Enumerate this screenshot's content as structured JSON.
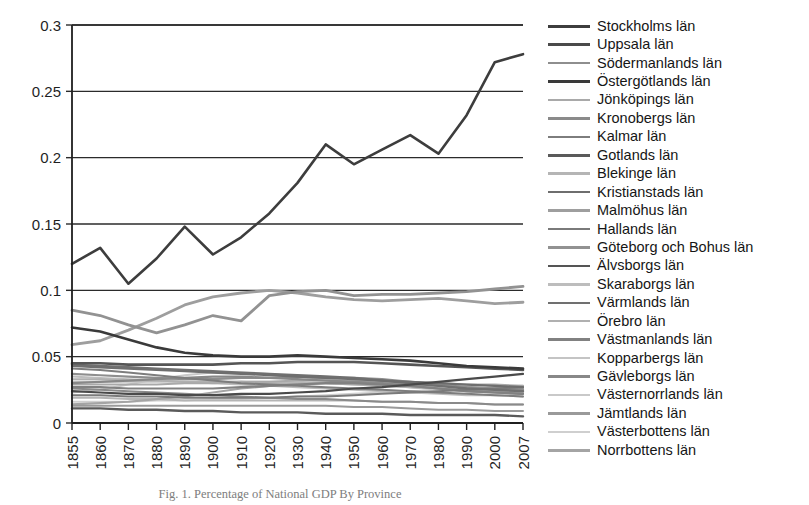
{
  "caption": "Fig. 1. Percentage of National GDP By Province",
  "axes": {
    "y_ticks": [
      "0",
      "0.05",
      "0.1",
      "0.15",
      "0.2",
      "0.25",
      "0.3"
    ],
    "x_ticks": [
      "1855",
      "1860",
      "1870",
      "1880",
      "1890",
      "1900",
      "1910",
      "1920",
      "1930",
      "1940",
      "1950",
      "1960",
      "1970",
      "1980",
      "1990",
      "2000",
      "2007"
    ]
  },
  "chart_data": {
    "type": "line",
    "title": "Fig. 1. Percentage of National GDP By Province",
    "xlabel": "",
    "ylabel": "",
    "ylim": [
      0,
      0.3
    ],
    "ytick_step": 0.05,
    "grid": "horizontal",
    "legend_position": "right",
    "x": [
      1855,
      1860,
      1870,
      1880,
      1890,
      1900,
      1910,
      1920,
      1930,
      1940,
      1950,
      1960,
      1970,
      1980,
      1990,
      2000,
      2007
    ],
    "series": [
      {
        "name": "Stockholms län",
        "color": "#3d3d3d",
        "width": 2.6,
        "values": [
          0.12,
          0.132,
          0.105,
          0.124,
          0.148,
          0.127,
          0.14,
          0.158,
          0.181,
          0.21,
          0.195,
          0.206,
          0.217,
          0.203,
          0.232,
          0.272,
          0.278
        ]
      },
      {
        "name": "Uppsala län",
        "color": "#4a4a4a",
        "width": 2.2,
        "values": [
          0.024,
          0.023,
          0.022,
          0.022,
          0.021,
          0.021,
          0.022,
          0.022,
          0.023,
          0.024,
          0.026,
          0.027,
          0.029,
          0.031,
          0.033,
          0.035,
          0.037
        ]
      },
      {
        "name": "Södermanlands län",
        "color": "#8e8e8e",
        "width": 2.2,
        "values": [
          0.037,
          0.036,
          0.035,
          0.034,
          0.033,
          0.033,
          0.034,
          0.034,
          0.035,
          0.034,
          0.034,
          0.033,
          0.031,
          0.029,
          0.027,
          0.026,
          0.025
        ]
      },
      {
        "name": "Östergötlands län",
        "color": "#3a3a3a",
        "width": 2.6,
        "values": [
          0.072,
          0.069,
          0.063,
          0.057,
          0.053,
          0.051,
          0.05,
          0.05,
          0.051,
          0.05,
          0.049,
          0.048,
          0.047,
          0.045,
          0.043,
          0.042,
          0.041
        ]
      },
      {
        "name": "Jönköpings län",
        "color": "#a9a9a9",
        "width": 2.0,
        "values": [
          0.029,
          0.029,
          0.029,
          0.029,
          0.03,
          0.03,
          0.031,
          0.031,
          0.032,
          0.032,
          0.032,
          0.031,
          0.031,
          0.03,
          0.029,
          0.029,
          0.028
        ]
      },
      {
        "name": "Kronobergs län",
        "color": "#8a8a8a",
        "width": 2.0,
        "values": [
          0.026,
          0.025,
          0.024,
          0.023,
          0.022,
          0.021,
          0.02,
          0.019,
          0.018,
          0.018,
          0.017,
          0.016,
          0.016,
          0.015,
          0.015,
          0.014,
          0.014
        ]
      },
      {
        "name": "Kalmar län",
        "color": "#7d7d7d",
        "width": 2.0,
        "values": [
          0.041,
          0.04,
          0.038,
          0.036,
          0.034,
          0.032,
          0.03,
          0.029,
          0.028,
          0.027,
          0.026,
          0.025,
          0.024,
          0.023,
          0.022,
          0.021,
          0.02
        ]
      },
      {
        "name": "Gotlands län",
        "color": "#5a5a5a",
        "width": 2.4,
        "values": [
          0.011,
          0.011,
          0.01,
          0.01,
          0.009,
          0.009,
          0.008,
          0.008,
          0.008,
          0.007,
          0.007,
          0.007,
          0.006,
          0.006,
          0.006,
          0.006,
          0.005
        ]
      },
      {
        "name": "Blekinge län",
        "color": "#b5b5b5",
        "width": 2.0,
        "values": [
          0.019,
          0.019,
          0.018,
          0.018,
          0.017,
          0.017,
          0.017,
          0.017,
          0.017,
          0.017,
          0.017,
          0.016,
          0.016,
          0.015,
          0.015,
          0.014,
          0.014
        ]
      },
      {
        "name": "Kristianstads län",
        "color": "#6e6e6e",
        "width": 2.2,
        "values": [
          0.043,
          0.042,
          0.041,
          0.04,
          0.039,
          0.038,
          0.037,
          0.036,
          0.035,
          0.034,
          0.033,
          0.032,
          0.031,
          0.03,
          0.029,
          0.028,
          0.027
        ]
      },
      {
        "name": "Malmöhus län",
        "color": "#9e9e9e",
        "width": 2.8,
        "values": [
          0.059,
          0.062,
          0.07,
          0.079,
          0.089,
          0.095,
          0.098,
          0.1,
          0.098,
          0.095,
          0.093,
          0.092,
          0.093,
          0.094,
          0.092,
          0.09,
          0.091
        ]
      },
      {
        "name": "Hallands län",
        "color": "#7a7a7a",
        "width": 2.0,
        "values": [
          0.021,
          0.021,
          0.02,
          0.02,
          0.019,
          0.019,
          0.019,
          0.019,
          0.02,
          0.02,
          0.021,
          0.022,
          0.023,
          0.024,
          0.025,
          0.026,
          0.027
        ]
      },
      {
        "name": "Göteborg och Bohus län",
        "color": "#929292",
        "width": 2.8,
        "values": [
          0.085,
          0.081,
          0.074,
          0.068,
          0.074,
          0.081,
          0.077,
          0.096,
          0.099,
          0.1,
          0.096,
          0.097,
          0.097,
          0.098,
          0.099,
          0.101,
          0.103
        ]
      },
      {
        "name": "Älvsborgs län",
        "color": "#555555",
        "width": 2.6,
        "values": [
          0.045,
          0.045,
          0.044,
          0.044,
          0.044,
          0.044,
          0.045,
          0.045,
          0.046,
          0.046,
          0.046,
          0.045,
          0.044,
          0.043,
          0.042,
          0.041,
          0.04
        ]
      },
      {
        "name": "Skaraborgs län",
        "color": "#bdbdbd",
        "width": 2.0,
        "values": [
          0.035,
          0.034,
          0.033,
          0.032,
          0.031,
          0.03,
          0.029,
          0.028,
          0.027,
          0.026,
          0.025,
          0.024,
          0.023,
          0.022,
          0.021,
          0.021,
          0.02
        ]
      },
      {
        "name": "Värmlands län",
        "color": "#707070",
        "width": 2.4,
        "values": [
          0.044,
          0.043,
          0.042,
          0.041,
          0.04,
          0.039,
          0.038,
          0.037,
          0.036,
          0.035,
          0.034,
          0.032,
          0.03,
          0.028,
          0.026,
          0.025,
          0.024
        ]
      },
      {
        "name": "Örebro län",
        "color": "#b0b0b0",
        "width": 2.0,
        "values": [
          0.033,
          0.033,
          0.032,
          0.032,
          0.031,
          0.031,
          0.031,
          0.03,
          0.03,
          0.03,
          0.029,
          0.028,
          0.027,
          0.026,
          0.025,
          0.024,
          0.023
        ]
      },
      {
        "name": "Västmanlands län",
        "color": "#818181",
        "width": 2.2,
        "values": [
          0.027,
          0.027,
          0.026,
          0.026,
          0.026,
          0.026,
          0.027,
          0.028,
          0.029,
          0.03,
          0.03,
          0.029,
          0.028,
          0.026,
          0.024,
          0.023,
          0.022
        ]
      },
      {
        "name": "Kopparbergs län",
        "color": "#c4c4c4",
        "width": 2.0,
        "values": [
          0.031,
          0.031,
          0.031,
          0.031,
          0.031,
          0.031,
          0.031,
          0.031,
          0.031,
          0.03,
          0.029,
          0.028,
          0.027,
          0.026,
          0.025,
          0.024,
          0.023
        ]
      },
      {
        "name": "Gävleborgs län",
        "color": "#888888",
        "width": 2.2,
        "values": [
          0.03,
          0.031,
          0.032,
          0.033,
          0.034,
          0.035,
          0.035,
          0.034,
          0.033,
          0.032,
          0.031,
          0.03,
          0.028,
          0.026,
          0.024,
          0.023,
          0.022
        ]
      },
      {
        "name": "Västernorrlands län",
        "color": "#c9c9c9",
        "width": 2.0,
        "values": [
          0.023,
          0.025,
          0.029,
          0.033,
          0.036,
          0.038,
          0.038,
          0.037,
          0.035,
          0.033,
          0.031,
          0.029,
          0.027,
          0.025,
          0.024,
          0.023,
          0.022
        ]
      },
      {
        "name": "Jämtlands län",
        "color": "#9a9a9a",
        "width": 2.0,
        "values": [
          0.013,
          0.013,
          0.013,
          0.013,
          0.013,
          0.013,
          0.013,
          0.013,
          0.013,
          0.013,
          0.012,
          0.012,
          0.011,
          0.01,
          0.01,
          0.009,
          0.009
        ]
      },
      {
        "name": "Västerbottens län",
        "color": "#cfcfcf",
        "width": 2.0,
        "values": [
          0.016,
          0.016,
          0.016,
          0.017,
          0.017,
          0.018,
          0.018,
          0.019,
          0.02,
          0.021,
          0.022,
          0.023,
          0.024,
          0.025,
          0.026,
          0.027,
          0.028
        ]
      },
      {
        "name": "Norrbottens län",
        "color": "#a4a4a4",
        "width": 2.2,
        "values": [
          0.014,
          0.015,
          0.016,
          0.018,
          0.02,
          0.023,
          0.026,
          0.028,
          0.029,
          0.03,
          0.03,
          0.03,
          0.029,
          0.028,
          0.027,
          0.026,
          0.026
        ]
      }
    ]
  }
}
